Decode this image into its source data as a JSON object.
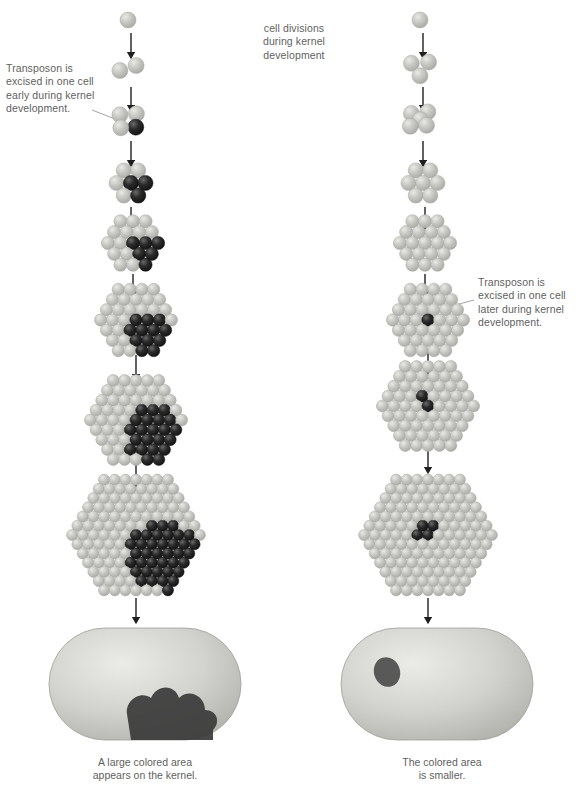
{
  "figure": {
    "title_center": "cell divisions\nduring kernel\ndevelopment",
    "background_color": "#ffffff",
    "text_color": "#5f5f5f"
  },
  "colors": {
    "cell_light": "#c9c9c5",
    "cell_light_highlight": "#e9e9e6",
    "cell_light_edge": "#a8a8a4",
    "cell_dark": "#2b2b2b",
    "cell_dark_highlight": "#6a6a6a",
    "cell_dark_edge": "#111111",
    "kernel_body": "#c4c4c0",
    "kernel_highlight": "#ebebe8",
    "kernel_spot": "#3a3a3a",
    "arrow": "#1f1f1f",
    "leader_line": "#9a9a9a"
  },
  "columns": [
    {
      "id": "left",
      "annotation": {
        "text": "Transposon is\nexcised in one cell\nearly during kernel\ndevelopment.",
        "x": 6,
        "y": 62,
        "align": "left"
      },
      "leader": {
        "x1": 92,
        "y1": 110,
        "x2": 128,
        "y2": 124
      },
      "caption": {
        "text": "A large colored area\nappears on the kernel.",
        "x": 15,
        "y": 756
      },
      "kernel": {
        "cx": 145,
        "cy": 684,
        "rx": 96,
        "ry": 56,
        "spot": "large-lower-right"
      },
      "stages": [
        {
          "index": 1,
          "cx": 128,
          "cy": 20,
          "rings": 0,
          "cell_r": 8.0,
          "dark": 0
        },
        {
          "index": 2,
          "cx": 128,
          "cy": 68,
          "rings": 0,
          "cell_r": 8.0,
          "dark": 0,
          "n_cells": 2
        },
        {
          "index": 3,
          "cx": 128,
          "cy": 120,
          "rings": 0,
          "cell_r": 8.0,
          "dark": 1,
          "n_cells": 4
        },
        {
          "index": 4,
          "cx": 131,
          "cy": 183,
          "rings": 1,
          "cell_r": 7.6,
          "dark": 3
        },
        {
          "index": 5,
          "cx": 133,
          "cy": 243,
          "rings": 2,
          "cell_r": 6.6,
          "dark": 6
        },
        {
          "index": 6,
          "cx": 136,
          "cy": 320,
          "rings": 3,
          "cell_r": 6.2,
          "dark": 12
        },
        {
          "index": 7,
          "cx": 136,
          "cy": 420,
          "rings": 4,
          "cell_r": 6.0,
          "dark": 22
        },
        {
          "index": 8,
          "cx": 136,
          "cy": 535,
          "rings": 6,
          "cell_r": 5.6,
          "dark": 38
        }
      ],
      "arrows": [
        {
          "x": 131,
          "y1": 33,
          "y2": 55
        },
        {
          "x": 131,
          "y1": 87,
          "y2": 108
        },
        {
          "x": 131,
          "y1": 141,
          "y2": 163
        },
        {
          "x": 131,
          "y1": 207,
          "y2": 226
        },
        {
          "x": 133,
          "y1": 274,
          "y2": 294
        },
        {
          "x": 136,
          "y1": 355,
          "y2": 377
        },
        {
          "x": 136,
          "y1": 463,
          "y2": 484
        },
        {
          "x": 136,
          "y1": 598,
          "y2": 620
        }
      ]
    },
    {
      "id": "right",
      "annotation": {
        "text": "Transposon is\nexcised in one cell\nlater during kernel\ndevelopment.",
        "x": 478,
        "y": 276,
        "align": "left"
      },
      "leader": {
        "x1": 474,
        "y1": 300,
        "x2": 422,
        "y2": 314
      },
      "caption": {
        "text": "The colored area\nis smaller.",
        "x": 312,
        "y": 756
      },
      "kernel": {
        "cx": 437,
        "cy": 684,
        "rx": 96,
        "ry": 56,
        "spot": "small-upper-left"
      },
      "stages": [
        {
          "index": 1,
          "cx": 420,
          "cy": 20,
          "rings": 0,
          "cell_r": 8.0,
          "dark": 0
        },
        {
          "index": 2,
          "cx": 420,
          "cy": 68,
          "rings": 0,
          "cell_r": 8.0,
          "dark": 0,
          "n_cells": 3
        },
        {
          "index": 3,
          "cx": 420,
          "cy": 120,
          "rings": 0,
          "cell_r": 8.0,
          "dark": 0,
          "n_cells": 5
        },
        {
          "index": 4,
          "cx": 423,
          "cy": 183,
          "rings": 1,
          "cell_r": 7.6,
          "dark": 0
        },
        {
          "index": 5,
          "cx": 425,
          "cy": 243,
          "rings": 2,
          "cell_r": 6.6,
          "dark": 0
        },
        {
          "index": 6,
          "cx": 428,
          "cy": 320,
          "rings": 3,
          "cell_r": 6.2,
          "dark": 1
        },
        {
          "index": 7,
          "cx": 428,
          "cy": 406,
          "rings": 4,
          "cell_r": 6.0,
          "dark": 2
        },
        {
          "index": 8,
          "cx": 428,
          "cy": 535,
          "rings": 6,
          "cell_r": 5.6,
          "dark": 4
        }
      ],
      "arrows": [
        {
          "x": 423,
          "y1": 33,
          "y2": 55
        },
        {
          "x": 423,
          "y1": 87,
          "y2": 108
        },
        {
          "x": 423,
          "y1": 141,
          "y2": 163
        },
        {
          "x": 425,
          "y1": 207,
          "y2": 226
        },
        {
          "x": 425,
          "y1": 274,
          "y2": 294
        },
        {
          "x": 428,
          "y1": 352,
          "y2": 374
        },
        {
          "x": 428,
          "y1": 447,
          "y2": 470
        },
        {
          "x": 428,
          "y1": 598,
          "y2": 620
        }
      ]
    }
  ],
  "center_label": {
    "x": 294,
    "y": 22,
    "width": 120
  }
}
